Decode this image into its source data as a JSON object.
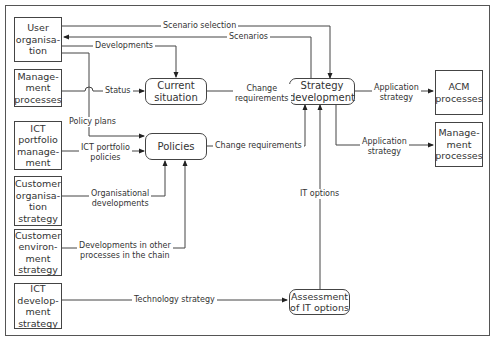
{
  "diagram": {
    "left_sources": [
      {
        "id": "user-organisation",
        "label": "User\norganisa-\ntion"
      },
      {
        "id": "management-processes-source",
        "label": "Manage-\nment\nprocesses"
      },
      {
        "id": "ict-portfolio-management",
        "label": "ICT\nportfolio\nmanage-\nment"
      },
      {
        "id": "customer-organisation-strategy",
        "label": "Customer\norganisa-\ntion\nstrategy"
      },
      {
        "id": "customer-environment-strategy",
        "label": "Customer\nenviron-\nment\nstrategy"
      },
      {
        "id": "ict-development-strategy",
        "label": "ICT\ndevelop-\nment\nstrategy"
      }
    ],
    "processes": [
      {
        "id": "current-situation",
        "label": "Current\nsituation"
      },
      {
        "id": "policies",
        "label": "Policies"
      },
      {
        "id": "strategy-development",
        "label": "Strategy\ndevelopment"
      },
      {
        "id": "assessment-of-it-options",
        "label": "Assessment\nof IT options"
      }
    ],
    "right_targets": [
      {
        "id": "acm-processes",
        "label": "ACM\nprocesses"
      },
      {
        "id": "management-processes-target",
        "label": "Manage-\nment\nprocesses"
      }
    ],
    "flows": [
      {
        "label": "Scenario selection",
        "from": "user-organisation",
        "to": "strategy-development"
      },
      {
        "label": "Scenarios",
        "from": "strategy-development",
        "to": "user-organisation"
      },
      {
        "label": "Developments",
        "from": "user-organisation",
        "to": "current-situation"
      },
      {
        "label": "Status",
        "from": "management-processes-source",
        "to": "current-situation"
      },
      {
        "label": "Policy plans",
        "from": "user-organisation",
        "to": "policies"
      },
      {
        "label": "ICT portfolio\npolicies",
        "from": "ict-portfolio-management",
        "to": "policies"
      },
      {
        "label": "Organisational\ndevelopments",
        "from": "customer-organisation-strategy",
        "to": "policies"
      },
      {
        "label": "Developments in other\nprocesses in the chain",
        "from": "customer-environment-strategy",
        "to": "policies"
      },
      {
        "label": "Technology strategy",
        "from": "ict-development-strategy",
        "to": "assessment-of-it-options"
      },
      {
        "label": "Change\nrequirements",
        "from": "current-situation",
        "to": "strategy-development"
      },
      {
        "label": "Change requirements",
        "from": "policies",
        "to": "strategy-development"
      },
      {
        "label": "IT options",
        "from": "assessment-of-it-options",
        "to": "strategy-development"
      },
      {
        "label": "Application\nstrategy",
        "from": "strategy-development",
        "to": "acm-processes"
      },
      {
        "label": "Application\nstrategy",
        "from": "strategy-development",
        "to": "management-processes-target"
      }
    ]
  }
}
